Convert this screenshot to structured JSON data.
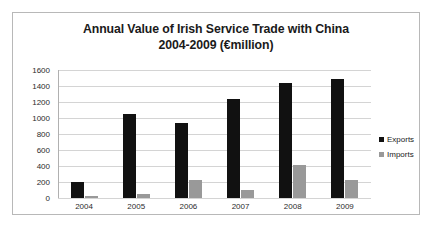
{
  "chart_data": {
    "type": "bar",
    "title": "Annual Value of Irish Service Trade with China 2004-2009 (€million)",
    "title_lines": [
      "Annual Value of Irish Service Trade with China",
      "2004-2009 (€million)"
    ],
    "xlabel": "",
    "ylabel": "",
    "categories": [
      "2004",
      "2005",
      "2006",
      "2007",
      "2008",
      "2009"
    ],
    "series": [
      {
        "name": "Exports",
        "color": "#111111",
        "values": [
          200,
          1050,
          940,
          1240,
          1440,
          1490
        ]
      },
      {
        "name": "Imports",
        "color": "#999999",
        "values": [
          30,
          55,
          230,
          100,
          410,
          220
        ]
      }
    ],
    "ylim": [
      0,
      1600
    ],
    "ytick_step": 200,
    "yticks": [
      0,
      200,
      400,
      600,
      800,
      1000,
      1200,
      1400,
      1600
    ],
    "grid": true,
    "grid_axis": "y",
    "legend_position": "right",
    "legend_entries": [
      "Exports",
      "Imports"
    ],
    "border_color": "#b8b8b8",
    "gridline_color": "#d4d4d4",
    "background": "#ffffff"
  }
}
